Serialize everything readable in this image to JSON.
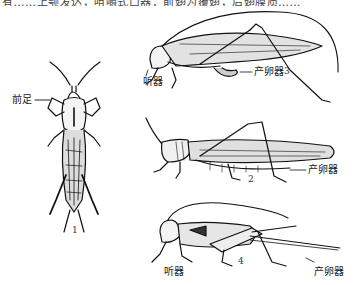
{
  "figure": {
    "top_caption_clipped": "有……上颚发达，咀嚼式口器；前翅为覆翅，后翅膜质……",
    "insects": [
      {
        "id": 1,
        "number": "1",
        "labels": [
          "前足"
        ]
      },
      {
        "id": 2,
        "number": "2",
        "labels": [
          "产卵器"
        ]
      },
      {
        "id": 3,
        "number": "3",
        "labels": [
          "听器",
          "产卵器"
        ]
      },
      {
        "id": 4,
        "number": "4",
        "labels": [
          "听器",
          "产卵器"
        ]
      }
    ]
  },
  "labels": {
    "foreleg": "前足",
    "ear_3": "听器",
    "ovipositor_3": "产卵器",
    "ovipositor_2": "产卵器",
    "ear_4": "听器",
    "ovipositor_4": "产卵器"
  },
  "numbers": {
    "n1": "1",
    "n2": "2",
    "n3": "3",
    "n4": "4"
  },
  "colors": {
    "ink": "#111111",
    "background": "#ffffff"
  }
}
